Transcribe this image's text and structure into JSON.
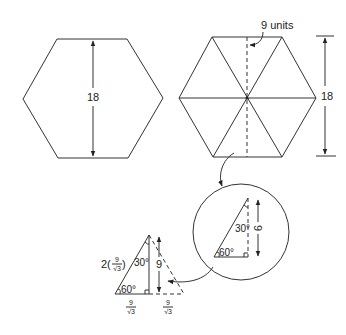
{
  "figure": {
    "left_hexagon": {
      "height_label": "18"
    },
    "right_hexagon": {
      "apothem_label": "9 units",
      "height_label": "18"
    },
    "magnified_triangle": {
      "angle_top": "30°",
      "angle_bottom": "60°",
      "height_label": "9"
    },
    "derived_triangle": {
      "hypotenuse_coef": "2",
      "hypotenuse_num": "9",
      "hypotenuse_den": "√3",
      "angle_top": "30°",
      "angle_bottom": "60°",
      "height_label": "9",
      "base_left_num": "9",
      "base_left_den": "√3",
      "base_right_num": "9",
      "base_right_den": "√3"
    }
  },
  "colors": {
    "line": "#333333",
    "background": "#ffffff"
  }
}
